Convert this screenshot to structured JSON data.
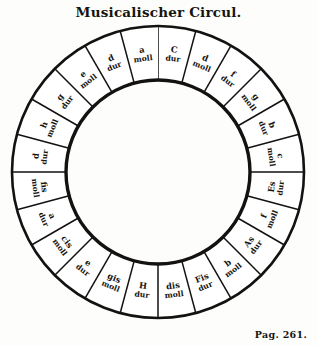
{
  "title": "Musicalischer Circul.",
  "page_label": "Pag. 261.",
  "figure": {
    "name": "circle-of-fifths-engraving",
    "outer_radius": 146,
    "mid_radius": 128,
    "inner_radius": 92,
    "segment_count": 24,
    "ink_color": "#141210",
    "paper_color": "#fdfdfb",
    "inner_circle_fill": "#ffffff"
  },
  "chart_data": {
    "type": "pie",
    "title": "Musicalischer Circul.",
    "subtitle": "",
    "xlabel": "",
    "ylabel": "",
    "legend": [],
    "grid": false,
    "categories": [
      "C dur",
      "a moll",
      "g dur",
      "e moll",
      "d dur",
      "h moll",
      "a dur",
      "fis moll",
      "e dur",
      "cis moll",
      "h dur",
      "gis moll",
      "Fis dur",
      "dis moll",
      "H dur",
      "es moll",
      "As dur",
      "b moll",
      "Es dur",
      "c moll",
      "b dur",
      "g moll",
      "f dur",
      "d moll"
    ],
    "values": [
      15,
      15,
      15,
      15,
      15,
      15,
      15,
      15,
      15,
      15,
      15,
      15,
      15,
      15,
      15,
      15,
      15,
      15,
      15,
      15,
      15,
      15,
      15,
      15
    ],
    "annotations": [
      "Pag. 261."
    ]
  },
  "segments": [
    {
      "note": "C",
      "mode": "dur",
      "angle": 7.5,
      "flip": false
    },
    {
      "note": "d",
      "mode": "moll",
      "angle": 22.5,
      "flip": false
    },
    {
      "note": "f",
      "mode": "dur",
      "angle": 37.5,
      "flip": false
    },
    {
      "note": "g",
      "mode": "moll",
      "angle": 52.5,
      "flip": false
    },
    {
      "note": "b",
      "mode": "dur",
      "angle": 67.5,
      "flip": false
    },
    {
      "note": "c",
      "mode": "moll",
      "angle": 82.5,
      "flip": false
    },
    {
      "note": "Es",
      "mode": "dur",
      "angle": 97.5,
      "flip": true
    },
    {
      "note": "f",
      "mode": "moll",
      "angle": 112.5,
      "flip": true
    },
    {
      "note": "As",
      "mode": "dur",
      "angle": 127.5,
      "flip": true
    },
    {
      "note": "b",
      "mode": "moll",
      "angle": 142.5,
      "flip": true
    },
    {
      "note": "Fis",
      "mode": "dur",
      "angle": 157.5,
      "flip": true
    },
    {
      "note": "dis",
      "mode": "moll",
      "angle": 172.5,
      "flip": true
    },
    {
      "note": "H",
      "mode": "dur",
      "angle": 187.5,
      "flip": true
    },
    {
      "note": "gis",
      "mode": "moll",
      "angle": 202.5,
      "flip": true
    },
    {
      "note": "e",
      "mode": "dur",
      "angle": 217.5,
      "flip": true
    },
    {
      "note": "cis",
      "mode": "moll",
      "angle": 232.5,
      "flip": true
    },
    {
      "note": "a",
      "mode": "dur",
      "angle": 247.5,
      "flip": true
    },
    {
      "note": "fis",
      "mode": "moll",
      "angle": 262.5,
      "flip": true
    },
    {
      "note": "d",
      "mode": "dur",
      "angle": 277.5,
      "flip": false
    },
    {
      "note": "h",
      "mode": "moll",
      "angle": 292.5,
      "flip": false
    },
    {
      "note": "g",
      "mode": "dur",
      "angle": 307.5,
      "flip": false
    },
    {
      "note": "e",
      "mode": "moll",
      "angle": 322.5,
      "flip": false
    },
    {
      "note": "d",
      "mode": "dur",
      "angle": 337.5,
      "flip": false
    },
    {
      "note": "a",
      "mode": "moll",
      "angle": 352.5,
      "flip": false
    }
  ]
}
